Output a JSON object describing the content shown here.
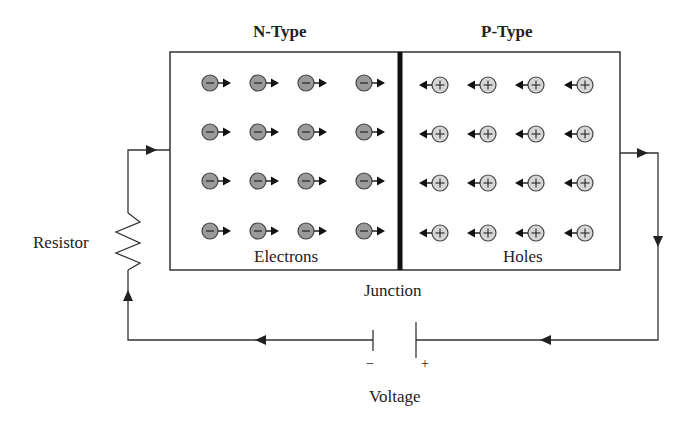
{
  "diagram": {
    "regions": [
      {
        "id": "n-type",
        "label": "N-Type",
        "carrier_label": "Electrons",
        "carrier_sign": "−",
        "carrier_direction": "right",
        "rows": 4,
        "cols": 4
      },
      {
        "id": "p-type",
        "label": "P-Type",
        "carrier_label": "Holes",
        "carrier_sign": "+",
        "carrier_direction": "left",
        "rows": 4,
        "cols": 4
      }
    ],
    "junction_label": "Junction",
    "resistor_label": "Resistor",
    "voltage_label": "Voltage",
    "battery": {
      "negative": "−",
      "positive": "+"
    },
    "colors": {
      "electron_fill": "#9a9a9a",
      "hole_fill": "#d6d6d6",
      "line": "#222222",
      "junction": "#111111"
    }
  }
}
